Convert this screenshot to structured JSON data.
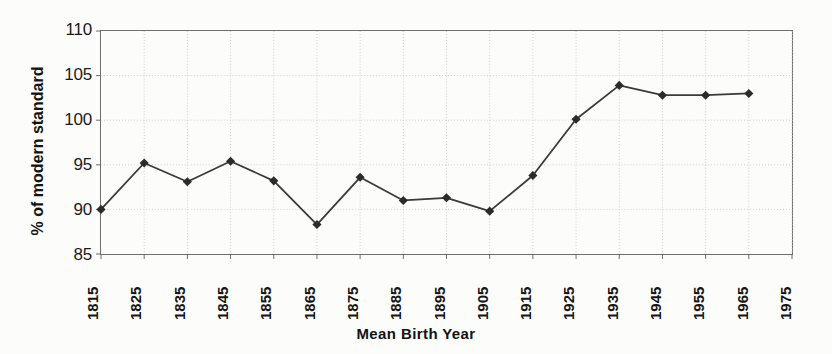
{
  "chart_data": {
    "type": "line",
    "title": "",
    "xlabel": "Mean Birth Year",
    "ylabel": "% of modern standard",
    "xlim": [
      1815,
      1975
    ],
    "ylim": [
      85,
      110
    ],
    "ytick_step": 5,
    "xtick_step": 10,
    "grid": true,
    "legend": null,
    "marker": "diamond",
    "line_color": "#3a3a3a",
    "marker_color": "#2b2b2b",
    "grid_color": "#cfcfcf",
    "axis_color": "#6e6e6e",
    "x": [
      1815,
      1825,
      1835,
      1845,
      1855,
      1865,
      1875,
      1885,
      1895,
      1905,
      1915,
      1925,
      1935,
      1945,
      1955,
      1965
    ],
    "values": [
      90.0,
      95.2,
      93.1,
      95.4,
      93.2,
      88.3,
      93.6,
      91.0,
      91.3,
      89.8,
      93.8,
      100.1,
      103.9,
      102.8,
      102.8,
      103.0
    ],
    "xticks": [
      "1815",
      "1825",
      "1835",
      "1845",
      "1855",
      "1865",
      "1875",
      "1885",
      "1895",
      "1905",
      "1915",
      "1925",
      "1935",
      "1945",
      "1955",
      "1965",
      "1975"
    ],
    "xtick_values": [
      1815,
      1825,
      1835,
      1845,
      1855,
      1865,
      1875,
      1885,
      1895,
      1905,
      1915,
      1925,
      1935,
      1945,
      1955,
      1965,
      1975
    ],
    "yticks": [
      "85",
      "90",
      "95",
      "100",
      "105",
      "110"
    ],
    "ytick_values": [
      85,
      90,
      95,
      100,
      105,
      110
    ]
  }
}
